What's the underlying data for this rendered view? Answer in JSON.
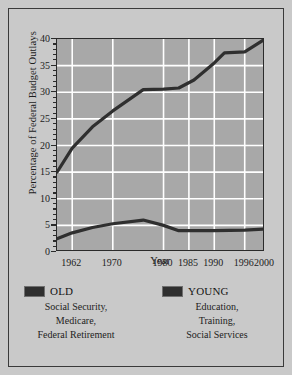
{
  "chart_data": {
    "type": "line",
    "title": "",
    "xlabel": "Year",
    "ylabel": "Percentage of Federal Budget Outlays",
    "xlim": [
      1959,
      2000
    ],
    "ylim": [
      0,
      40
    ],
    "yticks": [
      0,
      5,
      10,
      15,
      20,
      25,
      30,
      35,
      40
    ],
    "xticks": [
      1962,
      1970,
      1980,
      1985,
      1990,
      1996,
      2000
    ],
    "grid": "white gridlines at major ticks, both axes",
    "legend_position": "below plot, two columns",
    "series": [
      {
        "name": "OLD",
        "description": "Social Security, Medicare, Federal Retirement",
        "color": "#2f2f2f",
        "x": [
          1959,
          1962,
          1966,
          1970,
          1976,
          1980,
          1983,
          1986,
          1990,
          1992,
          1996,
          2000
        ],
        "values": [
          15.0,
          19.5,
          23.5,
          26.5,
          30.5,
          30.6,
          30.8,
          32.3,
          35.5,
          37.4,
          37.6,
          40.0
        ]
      },
      {
        "name": "YOUNG",
        "description": "Education, Training, Social Services",
        "color": "#2f2f2f",
        "x": [
          1959,
          1962,
          1966,
          1970,
          1976,
          1980,
          1983,
          1986,
          1990,
          1996,
          2000
        ],
        "values": [
          2.5,
          3.6,
          4.6,
          5.3,
          6.0,
          5.0,
          4.0,
          4.0,
          4.0,
          4.1,
          4.3
        ]
      }
    ]
  },
  "axis": {
    "ylabel": "Percentage of Federal Budget Outlays",
    "xlabel": "Year",
    "yticklabels": [
      "0",
      "5",
      "10",
      "15",
      "20",
      "25",
      "30",
      "35",
      "40"
    ],
    "xticklabels": [
      "1962",
      "1970",
      "1980",
      "1985",
      "1990",
      "1996",
      "2000"
    ]
  },
  "legend": {
    "entries": [
      {
        "label": "OLD",
        "lines": [
          "Social Security,",
          "Medicare,",
          "Federal Retirement"
        ]
      },
      {
        "label": "YOUNG",
        "lines": [
          "Education,",
          "Training,",
          "Social Services"
        ]
      }
    ]
  },
  "colors": {
    "page_background": "#c9c9c9",
    "plot_background": "#a8a8a8",
    "gridline": "#ffffff",
    "line": "#2f2f2f",
    "axis": "#2b2b2b",
    "text": "#1d1d1d"
  }
}
